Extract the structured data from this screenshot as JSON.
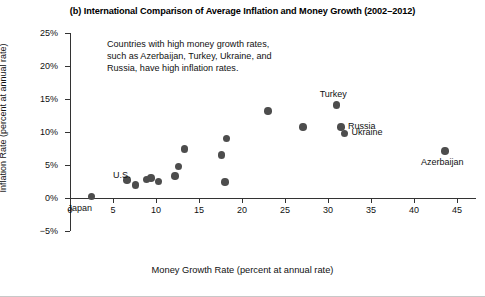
{
  "figure": {
    "panel_label": "(b)",
    "title": "(b) International Comparison of Average Inflation and Money Growth (2002–2012)"
  },
  "annotation": {
    "line1": "Countries with high money growth rates,",
    "line2": "such as Azerbaijan, Turkey, Ukraine, and",
    "line3": "Russia, have high inflation rates."
  },
  "colors": {
    "marker": "#4d4d4d",
    "axis": "#333333",
    "text": "#111111",
    "background": "#ffffff"
  },
  "chart_data": {
    "type": "scatter",
    "title": "(b) International Comparison of Average Inflation and Money Growth (2002–2012)",
    "xlabel": "Money Growth Rate (percent at annual rate)",
    "ylabel": "Inflation Rate (percent at annual rate)",
    "xlim": [
      0,
      47.2
    ],
    "ylim": [
      -5,
      25
    ],
    "xticks": [
      0,
      5,
      10,
      15,
      20,
      25,
      30,
      35,
      40,
      45
    ],
    "xtick_labels": [
      "0",
      "5",
      "10",
      "15",
      "20",
      "25",
      "30",
      "35",
      "40",
      "45"
    ],
    "yticks": [
      -5,
      0,
      5,
      10,
      15,
      20,
      25
    ],
    "ytick_labels": [
      "−5%",
      "0%",
      "5%",
      "10%",
      "15%",
      "20%",
      "25%"
    ],
    "grid": false,
    "legend": "none",
    "points": [
      {
        "x": 2.5,
        "y": 0.2,
        "label": "Japan",
        "label_pos": "below"
      },
      {
        "x": 6.6,
        "y": 2.7,
        "label": "",
        "label_pos": ""
      },
      {
        "x": 7.6,
        "y": 2.0,
        "label": "",
        "label_pos": ""
      },
      {
        "x": 8.9,
        "y": 2.8,
        "label": "",
        "label_pos": ""
      },
      {
        "x": 9.4,
        "y": 3.0,
        "label": "",
        "label_pos": ""
      },
      {
        "x": 10.3,
        "y": 2.5,
        "label": "",
        "label_pos": ""
      },
      {
        "x": 12.2,
        "y": 3.3,
        "label": "",
        "label_pos": ""
      },
      {
        "x": 12.6,
        "y": 4.8,
        "label": "",
        "label_pos": ""
      },
      {
        "x": 13.3,
        "y": 7.4,
        "label": "",
        "label_pos": ""
      },
      {
        "x": 17.6,
        "y": 6.5,
        "label": "",
        "label_pos": ""
      },
      {
        "x": 18.2,
        "y": 9.0,
        "label": "",
        "label_pos": ""
      },
      {
        "x": 18.0,
        "y": 2.4,
        "label": "",
        "label_pos": ""
      },
      {
        "x": 23.0,
        "y": 13.2,
        "label": "",
        "label_pos": ""
      },
      {
        "x": 27.1,
        "y": 10.8,
        "label": "",
        "label_pos": ""
      },
      {
        "x": 31.0,
        "y": 14.1,
        "label": "Turkey",
        "label_pos": "above"
      },
      {
        "x": 31.5,
        "y": 10.8,
        "label": "Russia",
        "label_pos": "right"
      },
      {
        "x": 31.9,
        "y": 9.8,
        "label": "Ukraine",
        "label_pos": "right"
      },
      {
        "x": 43.6,
        "y": 7.1,
        "label": "Azerbaijan",
        "label_pos": "below"
      }
    ],
    "extra_labels": [
      {
        "text": "U.S.",
        "x": 5.0,
        "y": 3.4,
        "anchor": "right-of-axis"
      }
    ]
  }
}
